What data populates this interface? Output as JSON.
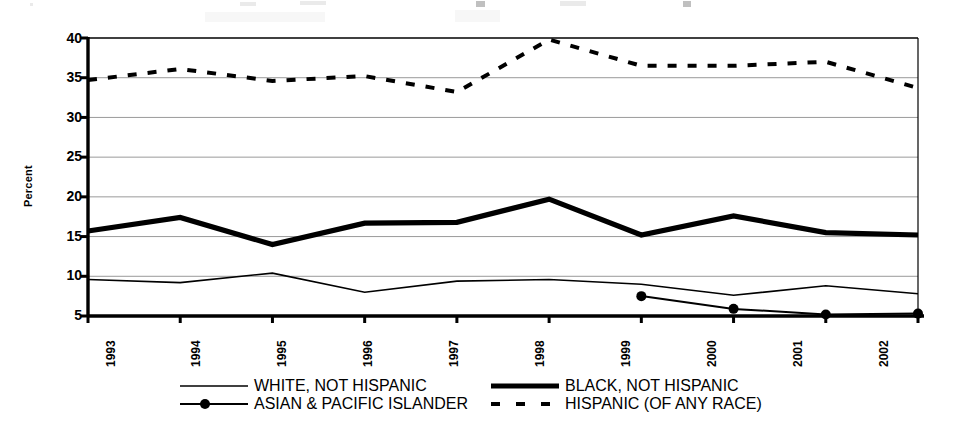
{
  "chart_data": {
    "type": "line",
    "title": "",
    "subtitle": "",
    "xlabel": "",
    "ylabel": "Percent",
    "categories": [
      "1993",
      "1994",
      "1995",
      "1996",
      "1997",
      "1998",
      "1999",
      "2000",
      "2001",
      "2002"
    ],
    "ylim": [
      5,
      40
    ],
    "ytick_labels": [
      "5",
      "10",
      "15",
      "20",
      "25",
      "30",
      "35",
      "40"
    ],
    "ytick_values": [
      5,
      10,
      15,
      20,
      25,
      30,
      35,
      40
    ],
    "grid": true,
    "grid_axis": "y",
    "legend_position": "bottom",
    "series": [
      {
        "name": "WHITE, NOT HISPANIC",
        "style": "solid-thin",
        "color": "#000000",
        "marker": "none",
        "values": [
          9.6,
          9.2,
          10.4,
          8.0,
          9.4,
          9.6,
          9.0,
          7.6,
          8.8,
          7.8
        ]
      },
      {
        "name": "BLACK, NOT HISPANIC",
        "style": "solid-thick",
        "color": "#000000",
        "marker": "none",
        "values": [
          15.7,
          17.4,
          14.0,
          16.7,
          16.8,
          19.7,
          15.2,
          17.6,
          15.5,
          15.2
        ]
      },
      {
        "name": "ASIAN & PACIFIC ISLANDER",
        "style": "solid-marker",
        "color": "#000000",
        "marker": "circle",
        "values": [
          null,
          null,
          null,
          null,
          null,
          null,
          7.5,
          5.9,
          5.2,
          5.3
        ]
      },
      {
        "name": "HISPANIC (OF ANY RACE)",
        "style": "dashed",
        "color": "#000000",
        "marker": "none",
        "values": [
          34.7,
          36.1,
          34.6,
          35.2,
          33.2,
          39.8,
          36.5,
          36.5,
          37.0,
          33.7
        ]
      }
    ]
  },
  "axes": {
    "y_title": "Percent",
    "y_labels": [
      "40",
      "35",
      "30",
      "25",
      "20",
      "15",
      "10",
      "5"
    ],
    "x_labels": [
      "1993",
      "1994",
      "1995",
      "1996",
      "1997",
      "1998",
      "1999",
      "2000",
      "2001",
      "2002"
    ]
  },
  "legend": {
    "items": [
      {
        "label": "WHITE, NOT HISPANIC",
        "swatch": "solid-thin-line-swatch"
      },
      {
        "label": "BLACK, NOT HISPANIC",
        "swatch": "solid-thick-line-swatch"
      },
      {
        "label": "ASIAN & PACIFIC ISLANDER",
        "swatch": "line-with-dot-marker-swatch"
      },
      {
        "label": "HISPANIC (OF ANY RACE)",
        "swatch": "dashed-line-swatch"
      }
    ]
  },
  "colors": {
    "ink": "#000000",
    "grid": "#9a9a9a",
    "background": "#ffffff"
  }
}
